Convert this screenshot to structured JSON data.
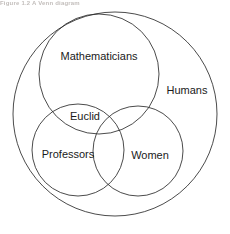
{
  "figure": {
    "type": "venn-diagram",
    "title": "",
    "background_color": "#ffffff",
    "stroke_color": "#2b2b2b",
    "text_color": "#1a1a1a",
    "width": 230,
    "height": 234
  },
  "caption": {
    "text": "Figure 1.2  A Venn diagram",
    "visible_state": "cropped-illegible"
  },
  "sets": {
    "universe": {
      "label": "Humans",
      "label_x": 187,
      "label_y": 91,
      "cx": 115,
      "cy": 114,
      "r": 102
    },
    "mathematicians": {
      "label": "Mathematicians",
      "label_x": 99,
      "label_y": 57,
      "cx": 99,
      "cy": 74,
      "r": 60
    },
    "professors": {
      "label": "Professors",
      "label_x": 68,
      "label_y": 155,
      "cx": 78,
      "cy": 150,
      "r": 46
    },
    "women": {
      "label": "Women",
      "label_x": 150,
      "label_y": 156,
      "cx": 138,
      "cy": 151,
      "r": 45
    }
  },
  "elements": {
    "intersection_label": {
      "label": "Euclid",
      "label_x": 85,
      "label_y": 117,
      "member_of": "Mathematicians and Professors"
    }
  }
}
